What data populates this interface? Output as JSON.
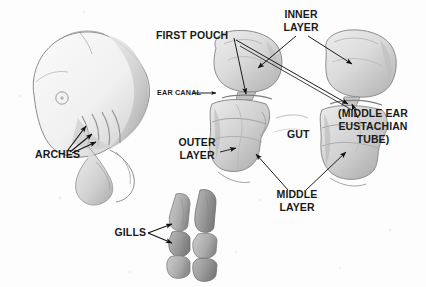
{
  "figure": {
    "background_color": "#fdfdfd",
    "ink_color": "#1a1a1a",
    "pencil_color": "#8d8d8d"
  },
  "labels": {
    "arches": "ARCHES",
    "gills": "GILLS",
    "first_pouch": "FIRST POUCH",
    "ear_canal": "EAR CANAL",
    "inner_layer_line1": "INNER",
    "inner_layer_line2": "LAYER",
    "outer_layer_line1": "OUTER",
    "outer_layer_line2": "LAYER",
    "middle_layer_line1": "MIDDLE",
    "middle_layer_line2": "LAYER",
    "gut": "GUT",
    "eustachian_line1": "(MIDDLE EAR",
    "eustachian_line2": "EUSTACHIAN",
    "eustachian_line3": "TUBE)"
  },
  "drawings": {
    "embryo_head": "pencil sketch of embryo head in profile with eye spot and pharyngeal arch folds",
    "cross_section_left": "pencil cross-section of pharynx showing first pouch, ear canal, outer/middle/inner layers and gut",
    "cross_section_right": "pencil cross-section showing middle ear eustachian tube formed from first pouch",
    "gill_stack": "two vertical columns of shaded gill segments"
  }
}
